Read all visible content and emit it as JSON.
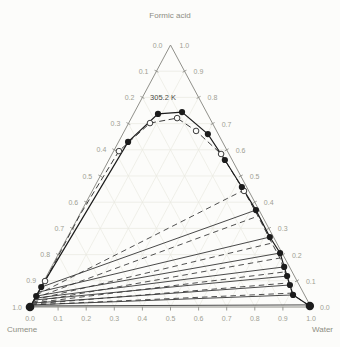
{
  "chart_data": {
    "type": "ternary-scatter",
    "corner_labels": {
      "top": "Formic acid",
      "bottom_left": "Cumene",
      "bottom_right": "Water"
    },
    "annotation": "305.2 K",
    "axes": {
      "left": {
        "component": "Formic acid (left edge scale)",
        "ticks": [
          "0.0",
          "0.1",
          "0.2",
          "0.3",
          "0.4",
          "0.5",
          "0.6",
          "0.7",
          "0.8",
          "0.9",
          "1.0"
        ]
      },
      "right": {
        "component": "Formic acid (right edge scale)",
        "ticks": [
          "1.0",
          "0.9",
          "0.8",
          "0.7",
          "0.6",
          "0.5",
          "0.4",
          "0.3",
          "0.2",
          "0.1",
          "0.0"
        ]
      },
      "bottom": {
        "component": "Water (bottom edge scale)",
        "ticks": [
          "0.0",
          "0.1",
          "0.2",
          "0.3",
          "0.4",
          "0.5",
          "0.6",
          "0.7",
          "0.8",
          "0.9",
          "1.0"
        ]
      },
      "grid_step": 0.1
    },
    "series": [
      {
        "name": "binodal-experimental",
        "marker": "filled-circle",
        "line": "solid",
        "points": [
          [
            1.0,
            0.0,
            0.0
          ],
          [
            0.957,
            0.042,
            0.001
          ],
          [
            0.922,
            0.076,
            0.002
          ],
          [
            0.336,
            0.63,
            0.034
          ],
          [
            0.176,
            0.737,
            0.087
          ],
          [
            0.087,
            0.744,
            0.169
          ],
          [
            0.037,
            0.66,
            0.303
          ],
          [
            0.026,
            0.561,
            0.413
          ],
          [
            0.017,
            0.458,
            0.525
          ],
          [
            0.011,
            0.37,
            0.619
          ],
          [
            0.013,
            0.267,
            0.72
          ],
          [
            0.007,
            0.206,
            0.787
          ],
          [
            0.019,
            0.153,
            0.828
          ],
          [
            0.026,
            0.118,
            0.856
          ],
          [
            0.033,
            0.084,
            0.883
          ],
          [
            0.041,
            0.046,
            0.913
          ],
          [
            0.002,
            0.004,
            0.994
          ]
        ]
      },
      {
        "name": "binodal-calculated",
        "marker": "open-circle",
        "line": "dashed",
        "points": [
          [
            0.989,
            0.008,
            0.003
          ],
          [
            0.897,
            0.099,
            0.004
          ],
          [
            0.647,
            0.351,
            0.002
          ],
          [
            0.386,
            0.595,
            0.019
          ],
          [
            0.222,
            0.702,
            0.076
          ],
          [
            0.116,
            0.721,
            0.163
          ],
          [
            0.073,
            0.672,
            0.255
          ],
          [
            0.028,
            0.584,
            0.388
          ],
          [
            0.017,
            0.443,
            0.54
          ],
          [
            0.015,
            0.347,
            0.638
          ],
          [
            0.017,
            0.244,
            0.739
          ],
          [
            0.017,
            0.187,
            0.796
          ],
          [
            0.026,
            0.134,
            0.84
          ],
          [
            0.032,
            0.092,
            0.876
          ],
          [
            0.041,
            0.049,
            0.91
          ],
          [
            0.004,
            0.004,
            0.992
          ]
        ],
        "marker_points": [
          [
            0.897,
            0.099,
            0.004
          ],
          [
            0.386,
            0.595,
            0.019
          ],
          [
            0.222,
            0.702,
            0.076
          ],
          [
            0.116,
            0.721,
            0.163
          ],
          [
            0.073,
            0.672,
            0.255
          ],
          [
            0.028,
            0.584,
            0.388
          ],
          [
            0.017,
            0.443,
            0.54
          ]
        ]
      }
    ],
    "tie_lines_experimental": [
      [
        [
          0.922,
          0.076,
          0.002
        ],
        [
          0.011,
          0.37,
          0.619
        ]
      ],
      [
        [
          0.94,
          0.057,
          0.003
        ],
        [
          0.013,
          0.267,
          0.72
        ]
      ],
      [
        [
          0.954,
          0.042,
          0.004
        ],
        [
          0.007,
          0.206,
          0.787
        ]
      ],
      [
        [
          0.962,
          0.034,
          0.004
        ],
        [
          0.019,
          0.153,
          0.828
        ]
      ],
      [
        [
          0.969,
          0.027,
          0.004
        ],
        [
          0.026,
          0.118,
          0.856
        ]
      ],
      [
        [
          0.982,
          0.015,
          0.003
        ],
        [
          0.033,
          0.084,
          0.883
        ]
      ],
      [
        [
          0.989,
          0.008,
          0.003
        ],
        [
          0.041,
          0.046,
          0.913
        ]
      ],
      [
        [
          0.996,
          0.004,
          0.0
        ],
        [
          0.003,
          0.008,
          0.989
        ]
      ]
    ],
    "tie_lines_calculated": [
      [
        [
          0.954,
          0.046,
          0.0
        ],
        [
          0.014,
          0.447,
          0.539
        ]
      ],
      [
        [
          0.966,
          0.034,
          0.0
        ],
        [
          0.015,
          0.347,
          0.638
        ]
      ],
      [
        [
          0.973,
          0.027,
          0.0
        ],
        [
          0.017,
          0.244,
          0.739
        ]
      ],
      [
        [
          0.981,
          0.019,
          0.0
        ],
        [
          0.017,
          0.187,
          0.796
        ]
      ],
      [
        [
          0.985,
          0.015,
          0.0
        ],
        [
          0.026,
          0.134,
          0.84
        ]
      ],
      [
        [
          0.989,
          0.011,
          0.0
        ],
        [
          0.032,
          0.092,
          0.876
        ]
      ],
      [
        [
          0.992,
          0.008,
          0.0
        ],
        [
          0.042,
          0.053,
          0.905
        ]
      ]
    ],
    "colors": {
      "axis": "#90908a",
      "tick_label": "#a09f93",
      "corner_label": "#8d8d82",
      "grid": "#e9e9e1",
      "experimental": "#1c1c1c",
      "calculated": "#3c3c3c",
      "tie_solid": "#343434",
      "annotation": "#4c4c46",
      "background": "#fcfcfa"
    }
  }
}
